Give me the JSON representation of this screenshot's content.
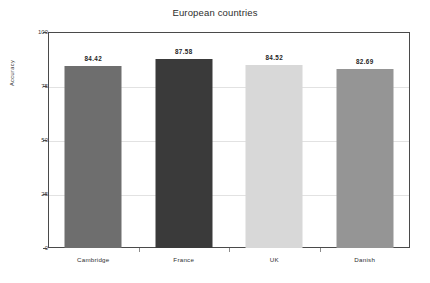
{
  "chart_data": {
    "type": "bar",
    "title": "European countries",
    "xlabel": "",
    "ylabel": "Accuracy",
    "categories": [
      "Cambridge",
      "France",
      "UK",
      "Danish"
    ],
    "values": [
      84.42,
      87.58,
      84.52,
      82.69
    ],
    "value_labels": [
      "84.42",
      "87.58",
      "84.52",
      "82.69"
    ],
    "bar_colors": [
      "#6e6e6e",
      "#3a3a3a",
      "#d8d8d8",
      "#959595"
    ],
    "ylim": [
      0,
      100
    ],
    "yticks": [
      0,
      25,
      50,
      75,
      100
    ],
    "ytick_labels": [
      "0",
      "25",
      "50",
      "75",
      "100"
    ],
    "grid": true,
    "legend": "none",
    "frame_color": "#4a4a4a",
    "gridline_color": "#e2e2e2",
    "background_color": "#ffffff"
  }
}
